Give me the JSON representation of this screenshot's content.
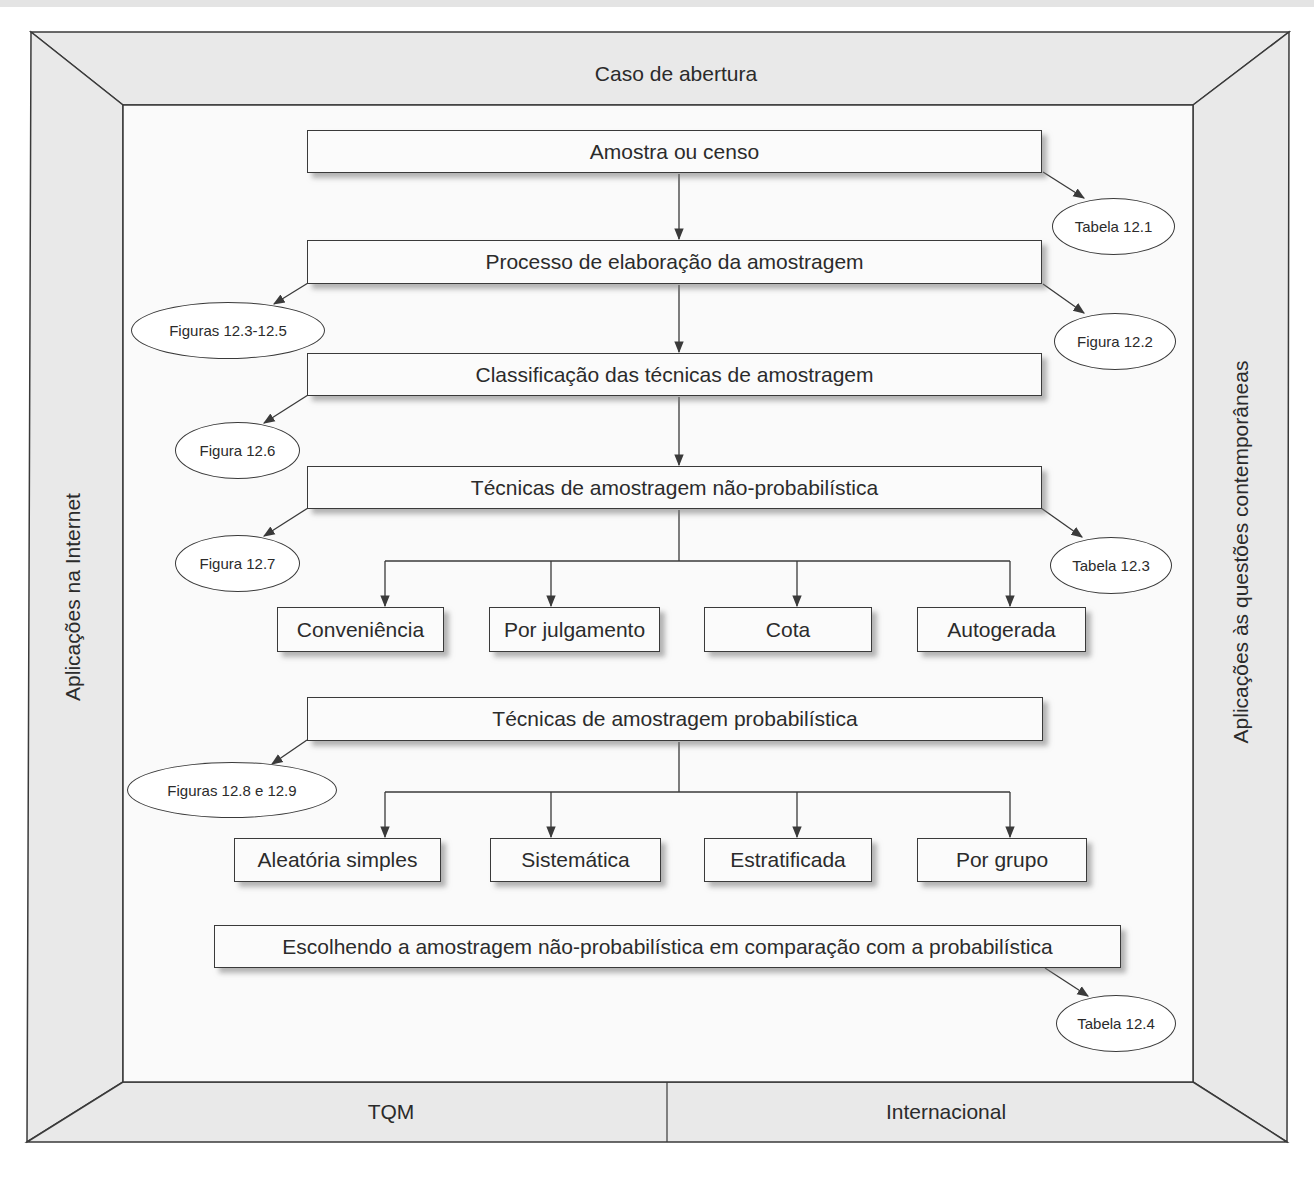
{
  "frame": {
    "top": "Caso de abertura",
    "left": "Aplicações na Internet",
    "right": "Aplicações às questões contemporâneas",
    "bottom_left": "TQM",
    "bottom_right": "Internacional"
  },
  "main_boxes": [
    {
      "id": "amostra-censo",
      "label": "Amostra ou censo"
    },
    {
      "id": "processo-elaboracao",
      "label": "Processo de elaboração da amostragem"
    },
    {
      "id": "classificacao-tecnicas",
      "label": "Classificação das técnicas de amostragem"
    },
    {
      "id": "nao-probabilistica",
      "label": "Técnicas de amostragem não-probabilística"
    },
    {
      "id": "probabilistica",
      "label": "Técnicas de amostragem probabilística"
    },
    {
      "id": "escolhendo",
      "label": "Escolhendo a amostragem não-probabilística em comparação com a probabilística"
    }
  ],
  "non_probabilistic_techniques": [
    {
      "label": "Conveniência"
    },
    {
      "label": "Por julgamento"
    },
    {
      "label": "Cota"
    },
    {
      "label": "Autogerada"
    }
  ],
  "probabilistic_techniques": [
    {
      "label": "Aleatória simples"
    },
    {
      "label": "Sistemática"
    },
    {
      "label": "Estratificada"
    },
    {
      "label": "Por grupo"
    }
  ],
  "references": [
    {
      "label": "Tabela 12.1",
      "attached_to": "Amostra ou censo"
    },
    {
      "label": "Figuras 12.3-12.5",
      "attached_to": "Processo de elaboração da amostragem"
    },
    {
      "label": "Figura 12.2",
      "attached_to": "Processo de elaboração da amostragem"
    },
    {
      "label": "Figura 12.6",
      "attached_to": "Classificação das técnicas de amostragem"
    },
    {
      "label": "Figura 12.7",
      "attached_to": "Técnicas de amostragem não-probabilística"
    },
    {
      "label": "Tabela 12.3",
      "attached_to": "Técnicas de amostragem não-probabilística"
    },
    {
      "label": "Figuras 12.8 e 12.9",
      "attached_to": "Técnicas de amostragem probabilística"
    },
    {
      "label": "Tabela 12.4",
      "attached_to": "Escolhendo a amostragem não-probabilística em comparação com a probabilística"
    }
  ],
  "colors": {
    "frame_fill": "#e9e9e9",
    "line": "#3a3a3a",
    "box_fill": "#fbfbfb"
  }
}
